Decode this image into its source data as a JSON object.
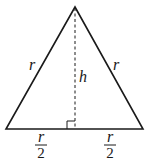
{
  "diagram": {
    "type": "isosceles-triangle",
    "labels": {
      "left_side": "r",
      "right_side": "r",
      "height": "h",
      "left_base_numerator": "r",
      "left_base_denominator": "2",
      "right_base_numerator": "r",
      "right_base_denominator": "2"
    },
    "colors": {
      "stroke": "#1a1a1a",
      "background": "#ffffff"
    }
  }
}
